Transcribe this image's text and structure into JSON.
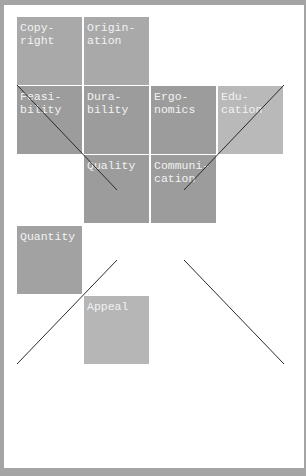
{
  "diagram": {
    "cells": [
      {
        "id": "copyright",
        "label": "Copy-\nright",
        "x": 17,
        "y": 17,
        "color": "#a9a9a9"
      },
      {
        "id": "origination",
        "label": "Origin-\nation",
        "x": 84,
        "y": 17,
        "color": "#a9a9a9"
      },
      {
        "id": "feasibility",
        "label": "Feasi-\nbility",
        "x": 17,
        "y": 86,
        "color": "#9c9c9c"
      },
      {
        "id": "durability",
        "label": "Dura-\nbility",
        "x": 84,
        "y": 86,
        "color": "#9c9c9c"
      },
      {
        "id": "ergonomics",
        "label": "Ergo-\nnomics",
        "x": 151,
        "y": 86,
        "color": "#9c9c9c"
      },
      {
        "id": "education",
        "label": "Edu-\ncation",
        "x": 218,
        "y": 86,
        "color": "#b9b9b9"
      },
      {
        "id": "quality",
        "label": "Quality",
        "x": 84,
        "y": 155,
        "color": "#9c9c9c"
      },
      {
        "id": "communication",
        "label": "Communi-\ncation",
        "x": 151,
        "y": 155,
        "color": "#9c9c9c"
      },
      {
        "id": "quantity",
        "label": "Quantity",
        "x": 17,
        "y": 226,
        "color": "#a2a2a2"
      },
      {
        "id": "appeal",
        "label": "Appeal",
        "x": 84,
        "y": 296,
        "color": "#b6b6b6"
      }
    ],
    "lines": [
      {
        "x1": 17,
        "y1": 85,
        "x2": 117,
        "y2": 190
      },
      {
        "x1": 284,
        "y1": 85,
        "x2": 184,
        "y2": 190
      },
      {
        "x1": 17,
        "y1": 364,
        "x2": 117,
        "y2": 260
      },
      {
        "x1": 184,
        "y1": 260,
        "x2": 284,
        "y2": 364
      }
    ]
  }
}
